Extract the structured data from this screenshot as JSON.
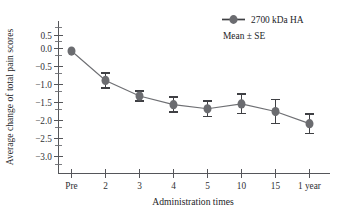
{
  "chart_data": {
    "type": "line",
    "title": "",
    "subtitle": "",
    "xlabel": "Administration times",
    "ylabel": "Average change of total pain scores",
    "categories": [
      "Pre",
      "2",
      "3",
      "4",
      "5",
      "10",
      "15",
      "1 year"
    ],
    "xtick_labels": [
      "Pre",
      "2",
      "3",
      "4",
      "5",
      "10",
      "15",
      "1 year"
    ],
    "ytick_labels": [
      "0.5",
      "0.0",
      "−0.5",
      "−1.0",
      "−1.5",
      "−2.0",
      "−2.5",
      "−3.0"
    ],
    "ytick_values": [
      0.5,
      0.0,
      -0.5,
      -1.0,
      -1.5,
      -2.0,
      -2.5,
      -3.0
    ],
    "ylim": [
      -3.45,
      0.85
    ],
    "grid": false,
    "legend_position": "top-right",
    "series": [
      {
        "name": "2700 kDa HA",
        "marker": "circle",
        "color": "#6b6c70",
        "values": [
          0.05,
          -0.8,
          -1.25,
          -1.5,
          -1.62,
          -1.48,
          -1.7,
          -2.05
        ],
        "errors": [
          0.0,
          0.21,
          0.15,
          0.22,
          0.22,
          0.28,
          0.35,
          0.28
        ]
      }
    ],
    "annotations": [
      "Mean ± SE"
    ]
  },
  "legend": {
    "series_label": "2700 kDa HA",
    "note": "Mean ± SE"
  },
  "axes": {
    "x_title": "Administration times",
    "y_title": "Average change of total pain scores"
  }
}
